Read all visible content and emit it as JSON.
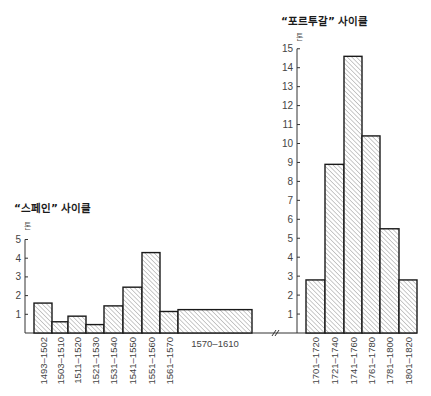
{
  "chart_data": [
    {
      "type": "bar",
      "title": "“스페인” 사이클",
      "ylabel": "톤",
      "xlabel": "",
      "ylim": [
        0,
        5
      ],
      "yticks": [
        1,
        2,
        3,
        4,
        5
      ],
      "grid": false,
      "legend": null,
      "categories": [
        "1493–1502",
        "1503–1510",
        "1511–1520",
        "1521–1530",
        "1531–1540",
        "1541–1550",
        "1551–1560",
        "1561–1570",
        "1570–1610"
      ],
      "values": [
        1.6,
        0.6,
        0.9,
        0.45,
        1.45,
        2.45,
        4.3,
        1.15,
        1.25
      ],
      "label_orientation": [
        "vertical",
        "vertical",
        "vertical",
        "vertical",
        "vertical",
        "vertical",
        "vertical",
        "vertical",
        "horizontal"
      ],
      "fill": "diagonal-hatch"
    },
    {
      "type": "bar",
      "title": "“포르투갈” 사이클",
      "ylabel": "톤",
      "xlabel": "",
      "ylim": [
        0,
        15
      ],
      "yticks": [
        1,
        2,
        3,
        4,
        5,
        6,
        7,
        8,
        9,
        10,
        11,
        12,
        13,
        14,
        15
      ],
      "grid": false,
      "legend": null,
      "categories": [
        "1701–1720",
        "1721–1740",
        "1741–1760",
        "1761–1780",
        "1781–1800",
        "1801–1820"
      ],
      "values": [
        2.8,
        8.9,
        14.6,
        10.4,
        5.5,
        2.8
      ],
      "fill": "diagonal-hatch"
    }
  ],
  "left": {
    "title": "“스페인” 사이클",
    "unit": "톤"
  },
  "right": {
    "title": "“포르투갈” 사이클",
    "unit": "톤"
  },
  "colors": {
    "stroke": "#1a1a1a",
    "hatch": "#8a8a8a",
    "axis": "#333333",
    "text": "#444444"
  }
}
